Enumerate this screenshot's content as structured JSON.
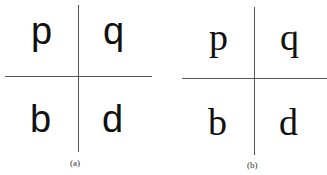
{
  "figure": {
    "panels": [
      {
        "caption": "(a)",
        "style": "sans-serif",
        "quadrants": {
          "top_left": "p",
          "top_right": "q",
          "bottom_left": "b",
          "bottom_right": "d"
        }
      },
      {
        "caption": "(b)",
        "style": "serif",
        "quadrants": {
          "top_left": "p",
          "top_right": "q",
          "bottom_left": "b",
          "bottom_right": "d"
        }
      }
    ],
    "colors": {
      "line": "#555555",
      "text": "#111111",
      "background": "#ffffff"
    }
  }
}
